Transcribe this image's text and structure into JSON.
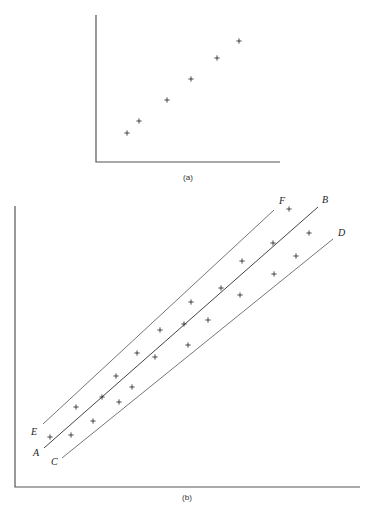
{
  "figure": {
    "panel_a": {
      "caption": "(a)",
      "axes": {
        "origin": [
          96,
          162
        ],
        "x_end": 280,
        "y_top": 15
      },
      "points": [
        [
          127,
          133
        ],
        [
          139,
          121
        ],
        [
          167,
          100
        ],
        [
          191,
          79
        ],
        [
          217,
          58
        ],
        [
          239,
          41
        ]
      ]
    },
    "panel_b": {
      "caption": "(b)",
      "axes": {
        "origin": [
          15,
          487
        ],
        "x_end": 360,
        "y_top": 206
      },
      "lines": [
        {
          "name": "EF",
          "start_label": "E",
          "end_label": "F",
          "x1": 43,
          "y1": 424,
          "x2": 274,
          "y2": 210,
          "role": "upper-bound"
        },
        {
          "name": "AB",
          "start_label": "A",
          "end_label": "B",
          "x1": 44,
          "y1": 448,
          "x2": 318,
          "y2": 207,
          "role": "best-fit"
        },
        {
          "name": "CD",
          "start_label": "C",
          "end_label": "D",
          "x1": 62,
          "y1": 458,
          "x2": 333,
          "y2": 239,
          "role": "lower-bound"
        }
      ],
      "labels": {
        "E": [
          31,
          435
        ],
        "A": [
          33,
          456
        ],
        "C": [
          51,
          465
        ],
        "F": [
          279,
          204
        ],
        "B": [
          322,
          203
        ],
        "D": [
          338,
          236
        ]
      },
      "points": [
        [
          50,
          437
        ],
        [
          71,
          435
        ],
        [
          76,
          407
        ],
        [
          93,
          421
        ],
        [
          102,
          397
        ],
        [
          116,
          376
        ],
        [
          119,
          402
        ],
        [
          132,
          387
        ],
        [
          137,
          353
        ],
        [
          155,
          357
        ],
        [
          160,
          330
        ],
        [
          184,
          324
        ],
        [
          188,
          345
        ],
        [
          191,
          302
        ],
        [
          208,
          320
        ],
        [
          221,
          288
        ],
        [
          240,
          295
        ],
        [
          242,
          261
        ],
        [
          273,
          243
        ],
        [
          274,
          274
        ],
        [
          289,
          209
        ],
        [
          296,
          256
        ],
        [
          309,
          233
        ]
      ]
    },
    "footer_caption": "Figure (partially cut off)"
  },
  "chart_data": [
    {
      "type": "scatter",
      "title": "(a)",
      "xlabel": "",
      "ylabel": "",
      "grid": false,
      "x": [
        1,
        1.5,
        2.7,
        3.7,
        4.8,
        5.7
      ],
      "y": [
        1.3,
        1.9,
        2.9,
        3.9,
        4.9,
        5.7
      ]
    },
    {
      "type": "scatter",
      "title": "(b)",
      "xlabel": "",
      "ylabel": "",
      "grid": false,
      "series": [
        {
          "name": "data points",
          "x": [
            50,
            71,
            76,
            93,
            102,
            116,
            119,
            132,
            137,
            155,
            160,
            184,
            188,
            191,
            208,
            221,
            240,
            242,
            273,
            274,
            289,
            296,
            309
          ],
          "y": [
            437,
            435,
            407,
            421,
            397,
            376,
            402,
            387,
            353,
            357,
            330,
            324,
            345,
            302,
            320,
            288,
            295,
            261,
            243,
            274,
            209,
            256,
            233
          ]
        },
        {
          "name": "line EF (upper)",
          "x": [
            43,
            274
          ],
          "y": [
            424,
            210
          ]
        },
        {
          "name": "line AB (best fit)",
          "x": [
            44,
            318
          ],
          "y": [
            448,
            207
          ]
        },
        {
          "name": "line CD (lower)",
          "x": [
            62,
            333
          ],
          "y": [
            458,
            239
          ]
        }
      ],
      "annotations": [
        "E",
        "F",
        "A",
        "B",
        "C",
        "D"
      ]
    }
  ]
}
